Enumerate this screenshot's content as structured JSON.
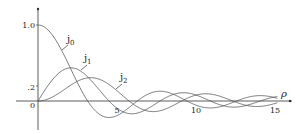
{
  "chart_data": {
    "type": "line",
    "title": "",
    "xlabel": "ρ",
    "ylabel": "",
    "xlim": [
      0,
      16
    ],
    "ylim": [
      -0.3,
      1.15
    ],
    "x_ticks": [
      "5",
      "10",
      "15"
    ],
    "y_ticks": [
      "1.0",
      ".2",
      "0"
    ],
    "grid": false,
    "legend": "inline labels",
    "series": [
      {
        "name": "j0",
        "label_main": "j",
        "label_sub": "0",
        "function": "sin(ρ)/ρ"
      },
      {
        "name": "j1",
        "label_main": "j",
        "label_sub": "1",
        "function": "sin(ρ)/ρ² − cos(ρ)/ρ"
      },
      {
        "name": "j2",
        "label_main": "j",
        "label_sub": "2",
        "function": "(3/ρ² − 1)sin(ρ)/ρ − 3cos(ρ)/ρ²"
      }
    ],
    "sample_points": {
      "x": [
        0,
        1,
        2,
        3,
        4,
        5,
        6,
        7,
        8,
        9,
        10,
        11,
        12,
        13,
        14,
        15
      ],
      "j0": [
        1.0,
        0.841,
        0.455,
        0.047,
        -0.189,
        -0.192,
        -0.047,
        0.094,
        0.124,
        0.046,
        -0.054,
        -0.091,
        -0.045,
        0.032,
        0.071,
        0.043
      ],
      "j1": [
        0.0,
        0.301,
        0.435,
        0.345,
        0.116,
        -0.095,
        -0.167,
        -0.092,
        0.031,
        0.106,
        0.078,
        -0.003,
        -0.079,
        -0.059,
        0.011,
        0.058
      ],
      "j2": [
        0.0,
        0.062,
        0.198,
        0.299,
        0.276,
        0.135,
        -0.037,
        -0.133,
        -0.139,
        -0.031,
        0.078,
        0.093,
        0.008,
        -0.068,
        -0.069,
        0.012
      ]
    }
  },
  "labels": {
    "y_top": "1.0",
    "y_mid": ".2",
    "origin": "0",
    "x5": "5",
    "x10": "10",
    "x15": "15",
    "axis_rho": "ρ",
    "j": "j",
    "sub0": "0",
    "sub1": "1",
    "sub2": "2"
  }
}
